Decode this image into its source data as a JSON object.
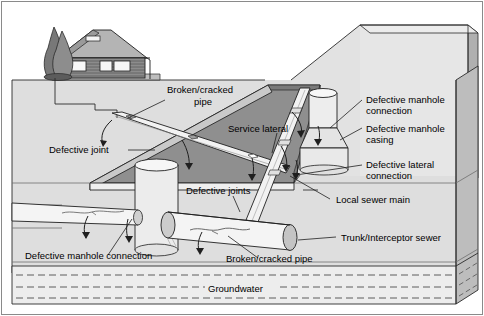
{
  "figure": {
    "type": "technical-cutaway-illustration"
  },
  "labels": {
    "broken_cracked_pipe_top_1": "Broken/cracked",
    "broken_cracked_pipe_top_2": "pipe",
    "service_lateral": "Service lateral",
    "defective_joint": "Defective joint",
    "defective_manhole_connection_top_1": "Defective manhole",
    "defective_manhole_connection_top_2": "connection",
    "defective_manhole_casing_1": "Defective manhole",
    "defective_manhole_casing_2": "casing",
    "defective_lateral_connection_1": "Defective lateral",
    "defective_lateral_connection_2": "connection",
    "local_sewer_main": "Local sewer main",
    "trunk_interceptor_sewer": "Trunk/Interceptor sewer",
    "defective_joints_mid": "Defective joints",
    "defective_manhole_connection_bottom": "Defective manhole connection",
    "broken_cracked_pipe_bottom": "Broken/cracked pipe",
    "groundwater": "Groundwater"
  },
  "colors": {
    "soil_front": "#d9d9d9",
    "soil_top": "#e8e8e8",
    "soil_side": "#b5b5b5",
    "street": "#8c8c8c",
    "street_edge": "#6f6f6f",
    "pipe_fill": "#f2f2f2",
    "pipe_shade": "#cfcfcf",
    "house_wall": "#8a8a8a",
    "house_roof": "#b0b0b0",
    "tree": "#7a7a7a",
    "outline": "#1a1a1a",
    "background": "#ffffff"
  },
  "elements": {
    "house": "single-story house with gable roof, gable vent, two windows, horizontal siding",
    "trees": "two conifer trees left of house",
    "manhole_upper": "upper manhole with tapered casing at street level",
    "manhole_lower": "lower manhole shaft cylinder",
    "trunk_sewer": "large horizontal trunk/interceptor sewer pipe",
    "local_sewer_main": "sloping local sewer main pipe",
    "service_lateral_pipe": "service lateral running from house to local sewer main",
    "groundwater_zone": "dashed hatched groundwater band at the base"
  }
}
